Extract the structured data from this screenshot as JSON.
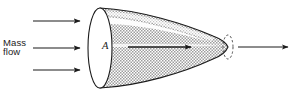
{
  "figure": {
    "type": "engineering-diagram",
    "background_color": "#ffffff",
    "width": 294,
    "height": 95
  },
  "labels": {
    "mass_flow_line1": "Mass",
    "mass_flow_line2": "flow",
    "area": "A"
  },
  "colors": {
    "outline": "#1b1b1b",
    "shading": "#b9b9b9",
    "shading_light": "#d6d6d6",
    "highlight": "#ffffff",
    "arrow": "#1b1b1b",
    "text": "#1b1b1b"
  },
  "arrows": {
    "inflow": [
      {
        "name": "inflow-arrow-top",
        "x1": 33,
        "y1": 21,
        "x2": 80,
        "y2": 21
      },
      {
        "name": "inflow-arrow-middle",
        "x1": 33,
        "y1": 48,
        "x2": 80,
        "y2": 48
      },
      {
        "name": "inflow-arrow-bottom",
        "x1": 33,
        "y1": 70,
        "x2": 80,
        "y2": 70
      }
    ],
    "internal": {
      "name": "internal-flow-arrow",
      "x1": 128,
      "y1": 47,
      "x2": 191,
      "y2": 47
    },
    "exit": {
      "name": "exit-jet-arrow",
      "x1": 238,
      "y1": 47,
      "x2": 288,
      "y2": 47
    }
  },
  "geometry": {
    "inlet_ellipse": {
      "cx": 100,
      "cy": 48,
      "rx": 12,
      "ry": 40
    },
    "exit_ellipse": {
      "cx": 228,
      "cy": 47,
      "rx": 5,
      "ry": 12,
      "dashed": true
    },
    "body_top_start_y": 8,
    "body_bottom_start_y": 88
  }
}
